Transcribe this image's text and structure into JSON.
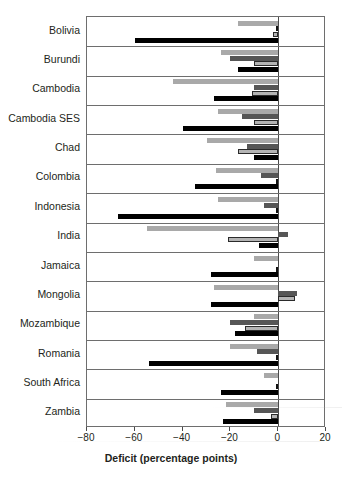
{
  "chart_data": {
    "type": "bar",
    "orientation": "horizontal",
    "title": "",
    "subtitle": "",
    "xlabel": "Deficit (percentage points)",
    "ylabel": "",
    "xlim": [
      -80,
      20
    ],
    "xticks": [
      -80,
      -60,
      -40,
      -20,
      0,
      20
    ],
    "xticklabels": [
      "−80",
      "−60",
      "−40",
      "−20",
      "0",
      "20"
    ],
    "grid": false,
    "legend": "none",
    "categories": [
      "Bolivia",
      "Burundi",
      "Cambodia",
      "Cambodia SES",
      "Chad",
      "Colombia",
      "Indonesia",
      "India",
      "Jamaica",
      "Mongolia",
      "Mozambique",
      "Romania",
      "South Africa",
      "Zambia"
    ],
    "series": [
      {
        "name": "series-1",
        "style": "light-gray",
        "color": "#a9a9a9",
        "values": [
          -17,
          -24,
          -44,
          -25,
          -30,
          -26,
          -25,
          -55,
          -10,
          -27,
          -10,
          -20,
          -6,
          -22
        ]
      },
      {
        "name": "series-2",
        "style": "dark-gray",
        "color": "#565656",
        "values": [
          -1,
          -20,
          -10,
          -15,
          -13,
          -7,
          -6,
          4,
          null,
          8,
          -20,
          -9,
          null,
          -10
        ]
      },
      {
        "name": "series-3",
        "style": "light-gray-outlined",
        "color": "#b4b4b4",
        "values": [
          -2,
          -10,
          -11,
          -10,
          -17,
          -1,
          -1,
          -21,
          -1,
          7,
          -14,
          -1,
          -1,
          -3
        ]
      },
      {
        "name": "series-4",
        "style": "black",
        "color": "#000000",
        "values": [
          -60,
          -17,
          -27,
          -40,
          -10,
          -35,
          -67,
          -8,
          -28,
          -28,
          -18,
          -54,
          -24,
          -23
        ]
      }
    ]
  },
  "axis": {
    "x_title": "Deficit (percentage points)",
    "tick_labels": [
      "−80",
      "−60",
      "−40",
      "−20",
      "0",
      "20"
    ],
    "tick_values": [
      -80,
      -60,
      -40,
      -20,
      0,
      20
    ]
  }
}
